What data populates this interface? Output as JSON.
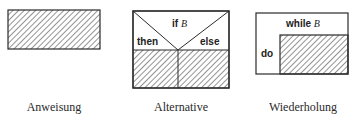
{
  "diagrams": [
    {
      "id": "anweisung",
      "caption": "Anweisung"
    },
    {
      "id": "alternative",
      "caption": "Alternative",
      "condition_keyword": "if",
      "condition_var": "B",
      "then_label": "then",
      "else_label": "else"
    },
    {
      "id": "wiederholung",
      "caption": "Wiederholung",
      "loop_keyword": "while",
      "loop_var": "B",
      "do_label": "do"
    }
  ],
  "colors": {
    "stroke": "#2a2a2a",
    "hatch": "#3a3a3a",
    "background": "#ffffff"
  }
}
